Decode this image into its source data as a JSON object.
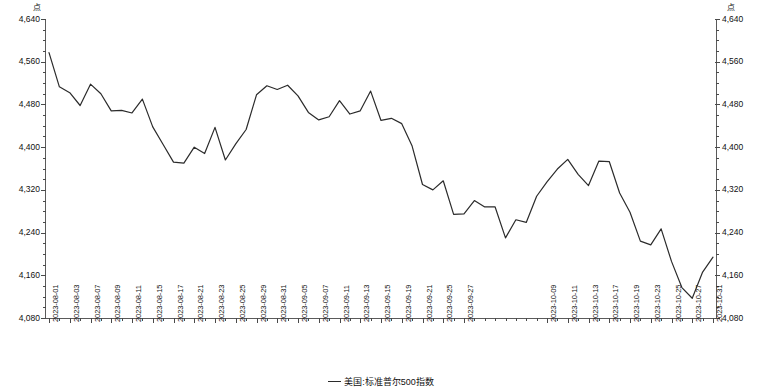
{
  "axes": {
    "unit_left": "点",
    "unit_right": "点",
    "y_ticks": [
      "4,640",
      "4,560",
      "4,480",
      "4,400",
      "4,320",
      "4,240",
      "4,160",
      "4,080"
    ],
    "y_min": 4080,
    "y_max": 4640,
    "y_step": 80
  },
  "legend": {
    "series_label": "美国:标准普尔500指数",
    "line_color": "#2b2b2b"
  },
  "chart_data": {
    "type": "line",
    "title": "",
    "subtitle": "",
    "xlabel": "",
    "ylabel": "点",
    "ylim": [
      4080,
      4640
    ],
    "grid": false,
    "legend_position": "bottom-center",
    "y_tick_values": [
      4080,
      4160,
      4240,
      4320,
      4400,
      4480,
      4560,
      4640
    ],
    "x_tick_labels": [
      "2023-08-01",
      "2023-08-03",
      "2023-08-07",
      "2023-08-09",
      "2023-08-11",
      "2023-08-15",
      "2023-08-17",
      "2023-08-21",
      "2023-08-23",
      "2023-08-25",
      "2023-08-29",
      "2023-08-31",
      "2023-09-05",
      "2023-09-07",
      "2023-09-11",
      "2023-09-13",
      "2023-09-15",
      "2023-09-19",
      "2023-09-21",
      "2023-09-25",
      "2023-09-27",
      "2023-10-09",
      "2023-10-11",
      "2023-10-13",
      "2023-10-17",
      "2023-10-19",
      "2023-10-23",
      "2023-10-25",
      "2023-10-27",
      "2023-10-31"
    ],
    "series": [
      {
        "name": "美国:标准普尔500指数",
        "color": "#2b2b2b",
        "x": [
          "2023-08-01",
          "2023-08-02",
          "2023-08-03",
          "2023-08-04",
          "2023-08-07",
          "2023-08-08",
          "2023-08-09",
          "2023-08-10",
          "2023-08-11",
          "2023-08-14",
          "2023-08-15",
          "2023-08-16",
          "2023-08-17",
          "2023-08-18",
          "2023-08-21",
          "2023-08-22",
          "2023-08-23",
          "2023-08-24",
          "2023-08-25",
          "2023-08-28",
          "2023-08-29",
          "2023-08-30",
          "2023-08-31",
          "2023-09-01",
          "2023-09-05",
          "2023-09-06",
          "2023-09-07",
          "2023-09-08",
          "2023-09-11",
          "2023-09-12",
          "2023-09-13",
          "2023-09-14",
          "2023-09-15",
          "2023-09-18",
          "2023-09-19",
          "2023-09-20",
          "2023-09-21",
          "2023-09-22",
          "2023-09-25",
          "2023-09-26",
          "2023-09-27",
          "2023-09-28",
          "2023-09-29",
          "2023-10-02",
          "2023-10-03",
          "2023-10-04",
          "2023-10-05",
          "2023-10-06",
          "2023-10-09",
          "2023-10-10",
          "2023-10-11",
          "2023-10-12",
          "2023-10-13",
          "2023-10-16",
          "2023-10-17",
          "2023-10-18",
          "2023-10-19",
          "2023-10-20",
          "2023-10-23",
          "2023-10-24",
          "2023-10-25",
          "2023-10-26",
          "2023-10-27",
          "2023-10-30",
          "2023-10-31"
        ],
        "values": [
          4577,
          4513,
          4502,
          4478,
          4518,
          4500,
          4468,
          4469,
          4464,
          4490,
          4438,
          4405,
          4372,
          4370,
          4400,
          4388,
          4437,
          4376,
          4406,
          4433,
          4498,
          4515,
          4508,
          4516,
          4496,
          4465,
          4451,
          4457,
          4487,
          4462,
          4468,
          4505,
          4450,
          4454,
          4444,
          4402,
          4330,
          4320,
          4337,
          4274,
          4275,
          4300,
          4288,
          4288,
          4230,
          4264,
          4259,
          4308,
          4335,
          4359,
          4377,
          4349,
          4328,
          4374,
          4373,
          4314,
          4278,
          4224,
          4217,
          4247,
          4186,
          4137,
          4117,
          4166,
          4194
        ]
      }
    ]
  }
}
